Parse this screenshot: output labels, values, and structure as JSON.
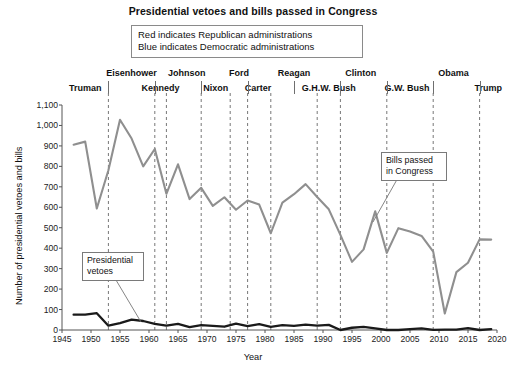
{
  "title": "Presidential vetoes and bills passed in Congress",
  "legend": {
    "line1": "Red indicates Republican administrations",
    "line2": "Blue indicates Democratic administrations"
  },
  "annotations": {
    "vetoes": "Presidential vetoes",
    "bills": "Bills passed in Congress"
  },
  "axes": {
    "xlabel": "Year",
    "ylabel": "Number of presidential vetoes and bills",
    "yticks": [
      "0",
      "100",
      "200",
      "300",
      "400",
      "500",
      "600",
      "700",
      "800",
      "900",
      "1,000",
      "1,100"
    ],
    "xticks": [
      "1945",
      "1950",
      "1955",
      "1960",
      "1965",
      "1970",
      "1975",
      "1980",
      "1985",
      "1990",
      "1995",
      "2000",
      "2005",
      "2010",
      "2015",
      "2020"
    ]
  },
  "presidents": [
    {
      "name": "Truman",
      "row": "bottom",
      "x": 1949.0
    },
    {
      "name": "Eisenhower",
      "row": "top",
      "x": 1957.0
    },
    {
      "name": "Kennedy",
      "row": "bottom",
      "x": 1962.0
    },
    {
      "name": "Johnson",
      "row": "top",
      "x": 1966.5
    },
    {
      "name": "Nixon",
      "row": "bottom",
      "x": 1971.5
    },
    {
      "name": "Ford",
      "row": "top",
      "x": 1975.5
    },
    {
      "name": "Carter",
      "row": "bottom",
      "x": 1978.8
    },
    {
      "name": "Reagan",
      "row": "top",
      "x": 1985.0
    },
    {
      "name": "G.H.W. Bush",
      "row": "bottom",
      "x": 1991.0
    },
    {
      "name": "Clinton",
      "row": "top",
      "x": 1996.5
    },
    {
      "name": "G.W. Bush",
      "row": "bottom",
      "x": 2004.5
    },
    {
      "name": "Obama",
      "row": "top",
      "x": 2012.5
    },
    {
      "name": "Trump",
      "row": "bottom",
      "x": 2018.5
    }
  ],
  "term_boundaries": [
    1953,
    1961,
    1963,
    1969,
    1974,
    1977,
    1981,
    1989,
    1993,
    2001,
    2009,
    2017
  ],
  "chart_data": {
    "type": "line",
    "title": "Presidential vetoes and bills passed in Congress",
    "xlabel": "Year",
    "ylabel": "Number of presidential vetoes and bills",
    "xlim": [
      1945,
      2020
    ],
    "ylim": [
      0,
      1100
    ],
    "grid": false,
    "legend_position": "annotated-callouts",
    "x": [
      1947,
      1949,
      1951,
      1953,
      1955,
      1957,
      1959,
      1961,
      1963,
      1965,
      1967,
      1969,
      1971,
      1973,
      1975,
      1977,
      1979,
      1981,
      1983,
      1985,
      1987,
      1989,
      1991,
      1993,
      1995,
      1997,
      1999,
      2001,
      2003,
      2005,
      2007,
      2009,
      2011,
      2013,
      2015,
      2017,
      2019
    ],
    "series": [
      {
        "name": "Bills passed in Congress",
        "color": "#8f8f8f",
        "values": [
          906,
          921,
          594,
          781,
          1028,
          936,
          800,
          885,
          666,
          810,
          640,
          695,
          607,
          649,
          588,
          633,
          613,
          473,
          623,
          664,
          713,
          650,
          590,
          465,
          333,
          394,
          580,
          377,
          498,
          482,
          460,
          383,
          81,
          283,
          329,
          443,
          442
        ]
      },
      {
        "name": "Presidential vetoes",
        "color": "#1a1a1a",
        "values": [
          75,
          75,
          82,
          21,
          34,
          51,
          44,
          30,
          21,
          30,
          14,
          24,
          20,
          16,
          31,
          19,
          29,
          15,
          24,
          20,
          26,
          21,
          25,
          0,
          11,
          15,
          8,
          0,
          0,
          4,
          8,
          1,
          2,
          2,
          9,
          0,
          4
        ]
      }
    ]
  }
}
